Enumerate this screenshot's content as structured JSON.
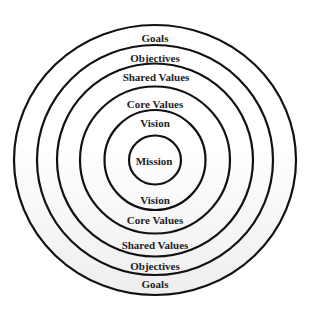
{
  "diagram": {
    "title": "",
    "center": {
      "x": 155,
      "y": 160
    },
    "stroke_color": "#111111",
    "fill_top": "#ffffff",
    "fill_bottom": "#efefef",
    "rings": [
      {
        "name": "goals",
        "rx": 141,
        "ry": 135
      },
      {
        "name": "objectives",
        "rx": 118,
        "ry": 115
      },
      {
        "name": "shared-values",
        "rx": 98,
        "ry": 96.5
      },
      {
        "name": "core-values",
        "rx": 75,
        "ry": 73.5
      },
      {
        "name": "vision",
        "rx": 50.5,
        "ry": 50
      },
      {
        "name": "mission",
        "rx": 26,
        "ry": 24.5
      }
    ],
    "labels": {
      "top": {
        "goals": "Goals",
        "objectives": "Objectives",
        "shared_values": "Shared Values",
        "core_values": "Core Values",
        "vision": "Vision"
      },
      "center": "Mission",
      "bottom": {
        "vision": "Vision",
        "core_values": "Core Values",
        "shared_values": "Shared Values",
        "objectives": "Objectives",
        "goals": "Goals"
      }
    }
  }
}
